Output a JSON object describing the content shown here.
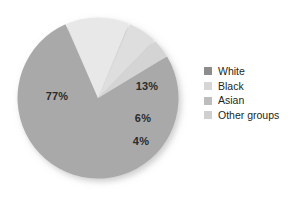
{
  "chart_data": {
    "type": "pie",
    "title": "",
    "subtitle": "",
    "xlabel": "",
    "ylabel": "",
    "grid": false,
    "legend_position": "right",
    "categories": [
      "White",
      "Black",
      "Asian",
      "Other groups"
    ],
    "values": [
      77,
      13,
      6,
      4
    ],
    "unit": "%",
    "data_labels": [
      "77%",
      "13%",
      "6%",
      "4%"
    ],
    "slice_colors": [
      "#a9a9a9",
      "#e8e8e8",
      "#dedede",
      "#d4d4d4"
    ],
    "legend_swatch_colors": [
      "#8c8c8c",
      "#d6d6d6",
      "#bdbdbd",
      "#cfcfcf"
    ],
    "start_angle_deg": -31,
    "direction": "clockwise",
    "background_color": "#ffffff",
    "label_color": "#2b2b2b",
    "slices": [
      {
        "label": "White",
        "value": 77,
        "data_label": "77%",
        "color": "#a9a9a9",
        "legend_swatch_color": "#8c8c8c",
        "label_x_pct": 29.1,
        "label_y_pct": 47.5
      },
      {
        "label": "Black",
        "value": 13,
        "data_label": "13%",
        "color": "#e8e8e8",
        "legend_swatch_color": "#d6d6d6",
        "label_x_pct": 48.8,
        "label_y_pct": 42.6
      },
      {
        "label": "Asian",
        "value": 6,
        "data_label": "6%",
        "color": "#dedede",
        "legend_swatch_color": "#bdbdbd",
        "label_x_pct": 47.2,
        "label_y_pct": 58.4
      },
      {
        "label": "Other groups",
        "value": 4,
        "data_label": "4%",
        "color": "#d4d4d4",
        "legend_swatch_color": "#cfcfcf",
        "label_x_pct": 46.5,
        "label_y_pct": 69.8
      }
    ]
  },
  "legend": {
    "items": [
      {
        "label": "White",
        "color": "#8c8c8c"
      },
      {
        "label": "Black",
        "color": "#d6d6d6"
      },
      {
        "label": "Asian",
        "color": "#bdbdbd"
      },
      {
        "label": "Other groups",
        "color": "#cfcfcf"
      }
    ]
  }
}
